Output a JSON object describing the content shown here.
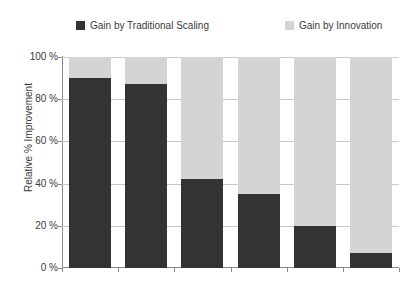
{
  "chart_data": {
    "type": "bar",
    "stacked": true,
    "title": "",
    "subtitle": "",
    "xlabel": "",
    "ylabel": "Relative % Improvement",
    "ylim": [
      0,
      100
    ],
    "yticks": [
      0,
      20,
      40,
      60,
      80,
      100
    ],
    "ytick_labels": [
      "0 %",
      "20 %",
      "40 %",
      "60 %",
      "80 %",
      "100 %"
    ],
    "xtick_labels": [
      "",
      "",
      "",
      "",
      "",
      ""
    ],
    "grid": true,
    "legend_position": "top",
    "categories": [
      "1",
      "2",
      "3",
      "4",
      "5",
      "6"
    ],
    "series": [
      {
        "name": "Gain by Traditional Scaling",
        "color": "#333333",
        "values": [
          90,
          87,
          42,
          35,
          20,
          7
        ]
      },
      {
        "name": "Gain by Innovation",
        "color": "#d4d4d4",
        "values": [
          10,
          13,
          58,
          65,
          80,
          93
        ]
      }
    ]
  },
  "legend": {
    "entries": [
      {
        "label": "Gain by Traditional Scaling",
        "color": "#333333"
      },
      {
        "label": "Gain by Innovation",
        "color": "#d4d4d4"
      }
    ]
  },
  "axes": {
    "y_title": "Relative % Improvement",
    "y_labels": [
      "100 %",
      "80 %",
      "60 %",
      "40 %",
      "20 %",
      "0 %"
    ]
  },
  "colors": {
    "axis": "#8a8a8a",
    "grid": "#c9c9c9",
    "text": "#3a3a3a",
    "background": "#ffffff"
  }
}
